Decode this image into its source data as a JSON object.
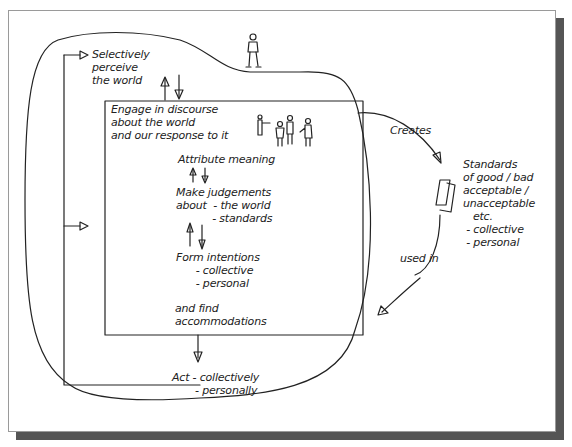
{
  "diagram": {
    "labels": {
      "perceive": "Selectively\nperceive\nthe world",
      "engage": "Engage in discourse\nabout the world\nand our response to it",
      "attribute": "Attribute meaning",
      "judgements": "Make judgements\nabout  - the world\n           - standards",
      "intentions": "Form intentions\n      - collective\n      - personal",
      "accommodations": "and find\naccommodations",
      "act": "Act - collectively\n       - personally",
      "creates": "Creates",
      "used_in": "used in",
      "standards": "Standards\nof good / bad\nacceptable /\nunacceptable\n   etc.\n - collective\n - personal"
    },
    "figures": {
      "observer": "person-figure",
      "group": "group-of-people"
    },
    "colors": {
      "line": "#222222",
      "shadow": "#555555",
      "background": "#ffffff"
    }
  }
}
